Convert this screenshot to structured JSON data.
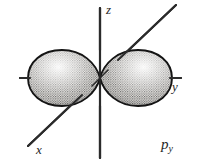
{
  "figure": {
    "type": "atomic-orbital-diagram",
    "caption_label": "p",
    "caption_subscript": "y",
    "background_color": "#ffffff",
    "ink_color": "#262626"
  },
  "axes": [
    {
      "name": "z",
      "label": "z",
      "orientation": "vertical",
      "from": [
        100,
        8
      ],
      "to": [
        100,
        158
      ]
    },
    {
      "name": "y",
      "label": "y",
      "orientation": "horizontal",
      "from": [
        20,
        78
      ],
      "to": [
        181,
        78
      ]
    },
    {
      "name": "x",
      "label": "x",
      "orientation": "diagonal",
      "from": [
        28,
        146
      ],
      "to": [
        176,
        5
      ]
    }
  ],
  "origin": {
    "x": 100,
    "y": 78
  },
  "lobes": [
    {
      "name": "lobe-negative-y",
      "side": "left",
      "tip": [
        100,
        78
      ],
      "extent": 72,
      "fill": "stipple"
    },
    {
      "name": "lobe-positive-y",
      "side": "right",
      "tip": [
        100,
        78
      ],
      "extent": 72,
      "fill": "stipple"
    }
  ],
  "labels": {
    "z_axis": "z",
    "y_axis": "y",
    "x_axis": "x",
    "orbital": "p",
    "orbital_subscript": "y"
  }
}
